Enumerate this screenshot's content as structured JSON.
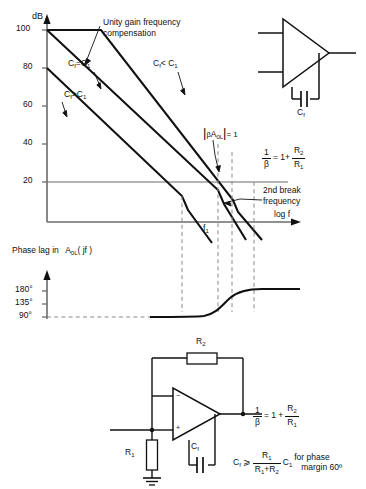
{
  "figure": {
    "title_hidden": "",
    "bode_plot": {
      "y_axis_label": "dB",
      "y_ticks": [
        "100",
        "80",
        "60",
        "40",
        "20"
      ],
      "x_axis_label": "log f",
      "x_tick_label": "f",
      "x_tick_sub": "1",
      "annotations": {
        "unity_gain_line1": "Unity gain frequency",
        "unity_gain_line2": "compensation",
        "curve_cf_eq": "C",
        "curve_cf_eq_sub": "f",
        "curve_cf_eq_rel": "=C",
        "curve_cf_eq_sub2": "1",
        "curve_cf_lt": "C",
        "curve_cf_lt_sub": "f",
        "curve_cf_lt_rel": "< C",
        "curve_cf_lt_sub2": "1",
        "curve_cf_gt": "C",
        "curve_cf_gt_sub": "f",
        "curve_cf_gt_rel": ">C",
        "curve_cf_gt_sub2": "1",
        "loop_gain_beta": "β",
        "loop_gain_a": "A",
        "loop_gain_a_sub": "0L",
        "loop_gain_eq": "= 1",
        "second_break_line1": "2nd break",
        "second_break_line2": "frequency",
        "beta_inv_num": "1",
        "beta_inv_den": "β",
        "beta_inv_eq": "= 1+",
        "beta_inv_r2": "R",
        "beta_inv_r2_sub": "2",
        "beta_inv_r1": "R",
        "beta_inv_r1_sub": "1"
      }
    },
    "phase_plot": {
      "caption_prefix": "Phase lag in",
      "caption_a": "A",
      "caption_a_sub": "0L",
      "caption_a_arg": "( jf )",
      "y_ticks": [
        "180°",
        "135°",
        "90°"
      ]
    },
    "opamp_symbol_top": {
      "cap_label": "C",
      "cap_label_sub": "f"
    },
    "circuit_bottom": {
      "r2_label": "R",
      "r2_label_sub": "2",
      "r1_label": "R",
      "r1_label_sub": "1",
      "cf_label": "C",
      "cf_label_sub": "f",
      "opamp_minus": "−",
      "opamp_plus": "+"
    },
    "equations": {
      "gain_num": "1",
      "gain_den": "β",
      "gain_eq": "= 1 +",
      "gain_r2": "R",
      "gain_r2_sub": "2",
      "gain_r1": "R",
      "gain_r1_sub": "1",
      "cond_cf": "C",
      "cond_cf_sub": "f",
      "cond_ge": "⩾",
      "cond_num": "R",
      "cond_num_sub": "1",
      "cond_den_r1": "R",
      "cond_den_r1_sub": "1",
      "cond_den_plus": "+",
      "cond_den_r2": "R",
      "cond_den_r2_sub": "2",
      "cond_c1": "C",
      "cond_c1_sub": "1",
      "cond_text_line1": "for phase",
      "cond_text_line2": "margin 60º"
    },
    "colors": {
      "ink": "#111111",
      "axis": "#6b6b6b",
      "dashed": "#8a8a8a"
    }
  }
}
